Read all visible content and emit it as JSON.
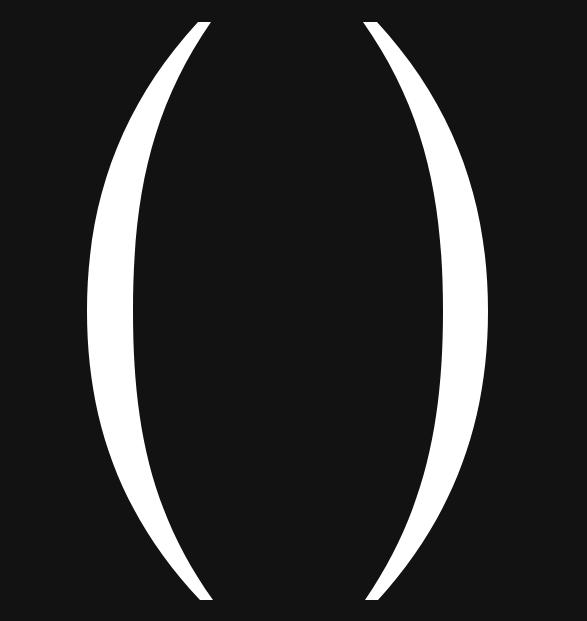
{
  "image": {
    "description": "Two large white parentheses on a black background",
    "glyphs": [
      "(",
      ")"
    ],
    "background_color": "#121212",
    "glyph_color": "#ffffff"
  }
}
